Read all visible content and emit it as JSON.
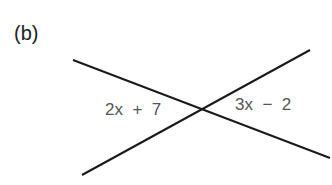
{
  "figure": {
    "part_label": "(b)",
    "angles": {
      "left": "2x  +  7",
      "right": "3x  −  2"
    },
    "lines": [
      {
        "x1": 73,
        "y1": 60,
        "x2": 330,
        "y2": 158
      },
      {
        "x1": 82,
        "y1": 175,
        "x2": 310,
        "y2": 50
      }
    ],
    "line_color": "#1a1a1a"
  }
}
